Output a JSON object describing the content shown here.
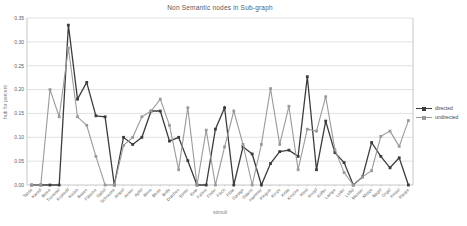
{
  "chart_data": {
    "type": "line",
    "title": "Non Semantic nodes in Sub-graph",
    "xlabel": "stimuli",
    "ylabel": "hub for percent",
    "ylim": [
      0,
      0.35
    ],
    "ytick_step": 0.05,
    "yticks": [
      "0.00",
      "0.05",
      "0.10",
      "0.15",
      "0.20",
      "0.25",
      "0.30",
      "0.35"
    ],
    "grid": "horizontal",
    "legend_position": "right",
    "categories": [
      "Tasse",
      "Kamel",
      "Biene",
      "Trommel",
      "Krokodil",
      "Kürbis",
      "Besen",
      "Flasche",
      "Gabel",
      "Schnecke",
      "Ampel",
      "Anker",
      "Apfel",
      "Birne",
      "Bluse",
      "Brille",
      "Drachen",
      "Eimer",
      "Ente",
      "Fahne",
      "Feder",
      "Fisch",
      "Flöte",
      "Garage",
      "Gitarre",
      "Hammer",
      "Pinguin",
      "Kerze",
      "Kette",
      "Kirsche",
      "Kleid",
      "Knopf",
      "Koffer",
      "Lampe",
      "Leiter",
      "Löffel",
      "Messer",
      "Mütze",
      "Nagel",
      "Orgel",
      "Pinsel",
      "Raupe"
    ],
    "series": [
      {
        "name": "directed",
        "color": "#3c3c3c",
        "values": [
          0.0,
          0.0,
          0.0,
          0.0,
          0.335,
          0.18,
          0.215,
          0.145,
          0.143,
          0.0,
          0.1,
          0.085,
          0.1,
          0.155,
          0.155,
          0.092,
          0.1,
          0.051,
          0.0,
          0.0,
          0.117,
          0.162,
          0.0,
          0.08,
          0.065,
          0.0,
          0.045,
          0.07,
          0.073,
          0.06,
          0.227,
          0.032,
          0.134,
          0.068,
          0.047,
          0.0,
          0.017,
          0.089,
          0.06,
          0.036,
          0.057,
          0.0
        ]
      },
      {
        "name": "undirected",
        "color": "#9a9a9a",
        "values": [
          0.0,
          0.0,
          0.2,
          0.143,
          0.287,
          0.143,
          0.125,
          0.06,
          0.0,
          0.0,
          0.083,
          0.1,
          0.143,
          0.155,
          0.18,
          0.125,
          0.032,
          0.162,
          0.0,
          0.115,
          0.0,
          0.08,
          0.155,
          0.085,
          0.0,
          0.085,
          0.202,
          0.085,
          0.165,
          0.032,
          0.117,
          0.113,
          0.185,
          0.074,
          0.026,
          0.0,
          0.017,
          0.03,
          0.102,
          0.113,
          0.081,
          0.135
        ]
      }
    ]
  },
  "style": {
    "plot_border_color": "#b8b8b8",
    "gridline_color": "#d9d9d9",
    "tick_label_color": "#595959",
    "category_label_color": "#595959"
  }
}
